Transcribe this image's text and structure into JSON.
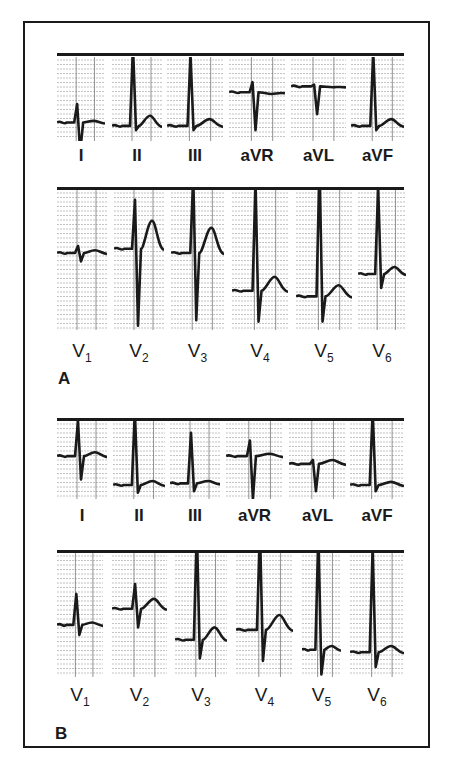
{
  "figure": {
    "panels": [
      {
        "letter": "A",
        "limb_leads": [
          "I",
          "II",
          "III",
          "aVR",
          "aVL",
          "aVF"
        ],
        "precordial_leads": [
          {
            "base": "V",
            "sub": "1"
          },
          {
            "base": "V",
            "sub": "2"
          },
          {
            "base": "V",
            "sub": "3"
          },
          {
            "base": "V",
            "sub": "4"
          },
          {
            "base": "V",
            "sub": "5"
          },
          {
            "base": "V",
            "sub": "6"
          }
        ]
      },
      {
        "letter": "B",
        "limb_leads": [
          "I",
          "II",
          "III",
          "aVR",
          "aVL",
          "aVF"
        ],
        "precordial_leads": [
          {
            "base": "V",
            "sub": "1"
          },
          {
            "base": "V",
            "sub": "2"
          },
          {
            "base": "V",
            "sub": "3"
          },
          {
            "base": "V",
            "sub": "4"
          },
          {
            "base": "V",
            "sub": "5"
          },
          {
            "base": "V",
            "sub": "6"
          }
        ]
      }
    ],
    "colors": {
      "ink": "#1a1a1a",
      "grid": "#9a9a9a",
      "paper": "#ffffff"
    }
  }
}
